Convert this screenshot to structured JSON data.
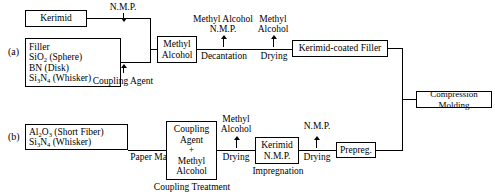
{
  "diagram": {
    "title_row_a": "(a)",
    "title_row_b": "(b)",
    "row_a": {
      "kerimid_box": "Kerimid",
      "filler_box": {
        "line1": "Filler",
        "line2_formula": "SiO",
        "line2_sub": "2",
        "line2_tail": " (Sphere)",
        "line3": "BN (Disk)",
        "line4_formula": "Si",
        "line4_sub1": "3",
        "line4_mid": "N",
        "line4_sub2": "4",
        "line4_tail": " (Whisker)"
      },
      "coupling_agent_label": "Coupling Agent",
      "nmp_input_label": "N.M.P.",
      "methyl_alcohol_box_l1": "Methyl",
      "methyl_alcohol_box_l2": "Alcohol",
      "decantation_label": "Decantation",
      "decantation_out_l1": "Methyl Alcohol",
      "decantation_out_l2": "N.M.P.",
      "drying_label": "Drying",
      "drying_out_l1": "Methyl",
      "drying_out_l2": "Alcohol",
      "kerimid_coated_filler_box": "Kerimid-coated Filler"
    },
    "row_b": {
      "materials_box": {
        "line1_formula": "Al",
        "line1_sub1": "2",
        "line1_mid": "O",
        "line1_sub2": "3",
        "line1_tail": " (Short Fiber)",
        "line2_formula": "Si",
        "line2_sub1": "3",
        "line2_mid": "N",
        "line2_sub2": "4",
        "line2_tail": " (Whisker)"
      },
      "paper_making_label": "Paper Making",
      "coupling_box_l1": "Coupling",
      "coupling_box_l2": "Agent",
      "coupling_box_l3": "+",
      "coupling_box_l4": "Methyl",
      "coupling_box_l5": "Alcohol",
      "coupling_treatment_label": "Coupling Treatment",
      "drying1_label": "Drying",
      "drying1_out_l1": "Methyl",
      "drying1_out_l2": "Alcohol",
      "kerimid_nmp_box_l1": "Kerimid",
      "kerimid_nmp_box_l2": "N.M.P.",
      "impregnation_label": "Impregnation",
      "drying2_label": "Drying",
      "drying2_out_label": "N.M.P.",
      "prepreg_box": "Prepreg."
    },
    "output": {
      "compression_molding_box": "Compression Molding"
    }
  }
}
